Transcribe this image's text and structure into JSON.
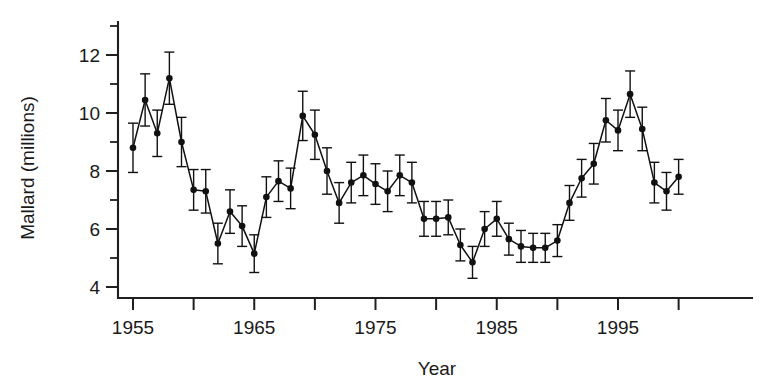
{
  "chart_data": {
    "type": "line",
    "title": "",
    "subtitle": "",
    "xlabel": "Year",
    "ylabel": "Mallard (millions)",
    "grid": false,
    "legend": null,
    "error_bars": "symmetric vertical whiskers with caps",
    "xlim": [
      1954,
      2001
    ],
    "ylim": [
      4,
      13
    ],
    "ytick_major": [
      4,
      6,
      8,
      10,
      12
    ],
    "ytick_minor": [
      5,
      7,
      9,
      11,
      13
    ],
    "ytick_labels": [
      "4",
      "6",
      "8",
      "10",
      "12"
    ],
    "xtick_major": [
      1955,
      1960,
      1965,
      1970,
      1975,
      1980,
      1985,
      1990,
      1995,
      2000
    ],
    "xtick_labels_shown": [
      "1955",
      "1965",
      "1975",
      "1985",
      "1995"
    ],
    "xtick_labeled_values": [
      1955,
      1965,
      1975,
      1985,
      1995
    ],
    "x": [
      1955,
      1956,
      1957,
      1958,
      1959,
      1960,
      1961,
      1962,
      1963,
      1964,
      1965,
      1966,
      1967,
      1968,
      1969,
      1970,
      1971,
      1972,
      1973,
      1974,
      1975,
      1976,
      1977,
      1978,
      1979,
      1980,
      1981,
      1982,
      1983,
      1984,
      1985,
      1986,
      1987,
      1988,
      1989,
      1990,
      1991,
      1992,
      1993,
      1994,
      1995,
      1996,
      1997,
      1998,
      1999,
      2000
    ],
    "values": [
      8.8,
      10.45,
      9.3,
      11.2,
      9.0,
      7.35,
      7.3,
      5.5,
      6.6,
      6.1,
      5.15,
      7.1,
      7.65,
      7.4,
      9.9,
      9.25,
      8.0,
      6.9,
      7.6,
      7.85,
      7.55,
      7.3,
      7.85,
      7.6,
      6.35,
      6.35,
      6.4,
      5.45,
      4.85,
      6.0,
      6.35,
      5.65,
      5.4,
      5.35,
      5.35,
      5.6,
      6.9,
      7.75,
      8.25,
      9.75,
      9.4,
      10.65,
      9.45,
      7.6,
      7.3,
      7.8
    ],
    "err_low": [
      0.85,
      0.9,
      0.8,
      0.9,
      0.85,
      0.7,
      0.75,
      0.7,
      0.75,
      0.7,
      0.65,
      0.7,
      0.7,
      0.7,
      0.85,
      0.85,
      0.8,
      0.7,
      0.7,
      0.7,
      0.7,
      0.7,
      0.7,
      0.7,
      0.6,
      0.6,
      0.6,
      0.55,
      0.55,
      0.6,
      0.6,
      0.55,
      0.55,
      0.5,
      0.5,
      0.55,
      0.6,
      0.65,
      0.7,
      0.75,
      0.7,
      0.8,
      0.75,
      0.7,
      0.65,
      0.6
    ],
    "err_high": [
      0.85,
      0.9,
      0.8,
      0.9,
      0.85,
      0.7,
      0.75,
      0.7,
      0.75,
      0.7,
      0.65,
      0.7,
      0.7,
      0.7,
      0.85,
      0.85,
      0.8,
      0.7,
      0.7,
      0.7,
      0.7,
      0.7,
      0.7,
      0.7,
      0.6,
      0.6,
      0.6,
      0.55,
      0.55,
      0.6,
      0.6,
      0.55,
      0.55,
      0.5,
      0.5,
      0.55,
      0.6,
      0.65,
      0.7,
      0.75,
      0.7,
      0.8,
      0.75,
      0.7,
      0.65,
      0.6
    ],
    "marker": "filled-circle",
    "line_color": "#111111",
    "marker_color": "#111111"
  },
  "axes": {
    "y_axis_name": "mallard-population-axis",
    "x_axis_name": "year-axis"
  }
}
